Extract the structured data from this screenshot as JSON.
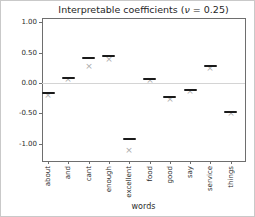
{
  "figure": {
    "title_parts": {
      "prefix": "Interpretable coefficients (",
      "nu": "ν",
      "suffix": " = 0.25)"
    }
  },
  "chart_data": {
    "type": "scatter",
    "subtype": "collapsed-boxplot-with-x-markers",
    "title": "Interpretable coefficients (ν = 0.25)",
    "xlabel": "words",
    "ylabel": "",
    "categories": [
      "about",
      "and",
      "cant",
      "enough",
      "excellent",
      "food",
      "good",
      "say",
      "service",
      "things"
    ],
    "series": [
      {
        "name": "coefficient-dash",
        "marker": "dash",
        "color": "#1a1a1a",
        "values": [
          -0.17,
          0.08,
          0.41,
          0.45,
          -0.93,
          0.06,
          -0.23,
          -0.11,
          0.28,
          -0.48
        ]
      },
      {
        "name": "coefficient-x",
        "marker": "x",
        "color": "#a9a9a9",
        "values": [
          -0.22,
          0.05,
          0.26,
          0.37,
          -1.12,
          0.03,
          -0.28,
          -0.15,
          0.23,
          -0.52
        ]
      }
    ],
    "yticks": {
      "labels": [
        "1.00",
        "0.50",
        "0.00",
        "-0.50",
        "-1.00"
      ],
      "values": [
        1.0,
        0.5,
        0.0,
        -0.5,
        -1.0
      ]
    },
    "ylim": [
      -1.27,
      1.07
    ],
    "xlim": [
      -0.3,
      9.7
    ],
    "x_tick_rotation": 90,
    "zero_line": true,
    "grid": false,
    "legend": "none",
    "colors": {
      "spine": "#6e6e6e",
      "zero_line": "#d4d4d4",
      "text": "#2b2b2b",
      "dash_marker": "#1a1a1a",
      "x_marker": "#a9a9a9"
    }
  }
}
